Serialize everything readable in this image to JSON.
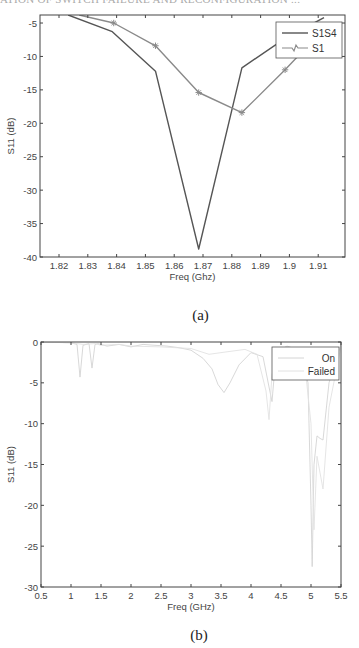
{
  "header": {
    "text": "ATION OF SWITCH FAILURE AND RECONFIGURATION ..."
  },
  "chart_data": [
    {
      "type": "line",
      "caption": "(a)",
      "title": "",
      "xlabel": "Freq (Ghz)",
      "ylabel": "S11 (dB)",
      "xlim": [
        1.8134,
        1.9193
      ],
      "ylim": [
        -40,
        -3.8
      ],
      "xticks": [
        1.82,
        1.83,
        1.84,
        1.85,
        1.86,
        1.87,
        1.88,
        1.89,
        1.9,
        1.91
      ],
      "xtick_labels": [
        "1.82",
        "1.83",
        "1.84",
        "1.85",
        "1.86",
        "1.87",
        "1.88",
        "1.89",
        "1.9",
        "1.91"
      ],
      "yticks": [
        -5,
        -10,
        -15,
        -20,
        -25,
        -30,
        -35,
        -40
      ],
      "ytick_labels": [
        "-5",
        "-10",
        "-15",
        "-20",
        "-25",
        "-30",
        "-35",
        "-40"
      ],
      "grid": false,
      "legend_position": "upper right",
      "series": [
        {
          "name": "S1S4",
          "color": "#555555",
          "marker": "none",
          "x": [
            1.8232,
            1.8385,
            1.8535,
            1.8685,
            1.8835,
            1.8985,
            1.912
          ],
          "y": [
            -3.8,
            -6.3,
            -12.2,
            -38.8,
            -11.7,
            -7.3,
            -4.2
          ]
        },
        {
          "name": "S1",
          "color": "#8a8a8a",
          "marker": "star",
          "x": [
            1.827,
            1.839,
            1.8535,
            1.8685,
            1.8835,
            1.8985,
            1.906
          ],
          "y": [
            -3.8,
            -5.0,
            -8.4,
            -15.4,
            -18.4,
            -12.0,
            -8.6
          ]
        }
      ]
    },
    {
      "type": "line",
      "caption": "(b)",
      "title": "",
      "xlabel": "Freq (GHz)",
      "ylabel": "S11 (dB)",
      "xlim": [
        0.5,
        5.5
      ],
      "ylim": [
        -30,
        0
      ],
      "xticks": [
        0.5,
        1,
        1.5,
        2,
        2.5,
        3,
        3.5,
        4,
        4.5,
        5,
        5.5
      ],
      "xtick_labels": [
        "0.5",
        "1",
        "1.5",
        "2",
        "2.5",
        "3",
        "3.5",
        "4",
        "4.5",
        "5",
        "5.5"
      ],
      "yticks": [
        0,
        -5,
        -10,
        -15,
        -20,
        -25,
        -30
      ],
      "ytick_labels": [
        "0",
        "-5",
        "-10",
        "-15",
        "-20",
        "-25",
        "-30"
      ],
      "grid": false,
      "legend_position": "upper right",
      "series": [
        {
          "name": "On",
          "color": "#d4d4d4",
          "x": [
            0.5,
            1.0,
            1.1,
            1.15,
            1.2,
            1.3,
            1.35,
            1.4,
            1.45,
            1.6,
            1.8,
            2.0,
            2.2,
            2.4,
            2.6,
            2.8,
            3.0,
            3.2,
            3.35,
            3.45,
            3.55,
            3.65,
            3.8,
            4.0,
            4.2,
            4.3,
            4.35,
            4.4,
            4.5,
            4.6,
            4.8,
            4.95,
            5.0,
            5.02,
            5.05,
            5.1,
            5.15,
            5.2,
            5.3,
            5.5
          ],
          "y": [
            0,
            -0.1,
            -0.3,
            -4.3,
            -0.4,
            -0.2,
            -3.2,
            -0.3,
            -0.2,
            -0.5,
            -0.3,
            -0.6,
            -0.3,
            -0.4,
            -0.5,
            -0.7,
            -1.0,
            -2.0,
            -3.3,
            -5.2,
            -6.2,
            -5.0,
            -2.8,
            -1.3,
            -1.8,
            -5.5,
            -7.3,
            -3.0,
            -0.9,
            -0.5,
            -1.0,
            -5.0,
            -20.0,
            -27.5,
            -15.0,
            -11.5,
            -11.8,
            -12.0,
            -5.0,
            -0.3
          ]
        },
        {
          "name": "Failed",
          "color": "#e2e2e2",
          "x": [
            0.5,
            1.0,
            1.2,
            1.4,
            1.5,
            1.8,
            2.0,
            2.5,
            3.0,
            3.3,
            3.6,
            3.9,
            4.1,
            4.25,
            4.3,
            4.35,
            4.45,
            4.6,
            4.9,
            5.0,
            5.05,
            5.1,
            5.2,
            5.3,
            5.5
          ],
          "y": [
            0,
            -0.1,
            -0.3,
            -0.2,
            -0.4,
            -0.3,
            -0.5,
            -0.6,
            -0.8,
            -1.5,
            -1.2,
            -0.9,
            -1.5,
            -6.0,
            -9.5,
            -4.0,
            -1.0,
            -0.6,
            -3.0,
            -10.0,
            -23.0,
            -14.0,
            -18.0,
            -8.0,
            -0.5
          ]
        }
      ]
    }
  ]
}
